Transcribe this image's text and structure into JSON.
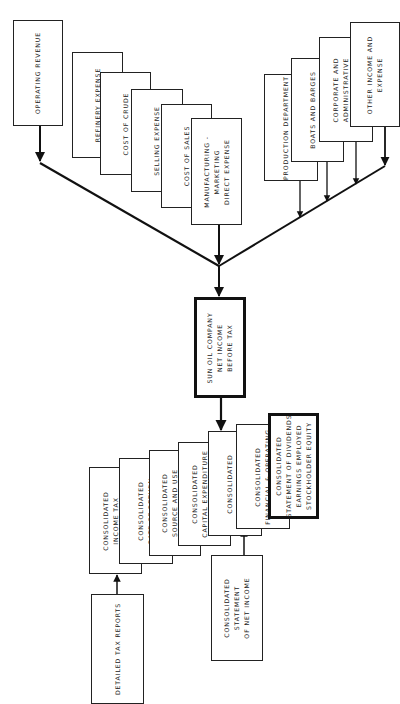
{
  "diagram": {
    "inputs": {
      "revenue": {
        "lines": [
          "OPERATING REVENUE"
        ]
      },
      "expenses_left": [
        {
          "lines": [
            "REFINERY EXPENSE"
          ]
        },
        {
          "lines": [
            "COST OF CRUDE"
          ]
        },
        {
          "lines": [
            "SELLING EXPENSE"
          ]
        },
        {
          "lines": [
            "COST OF SALES"
          ]
        },
        {
          "lines": [
            "MANUFACTURING -",
            "MARKETING",
            "DIRECT EXPENSE"
          ]
        }
      ],
      "expenses_right": [
        {
          "lines": [
            "PRODUCTION DEPARTMENT",
            "EXPENSE"
          ]
        },
        {
          "lines": [
            "BOATS AND BARGES",
            "EXPENSE"
          ]
        },
        {
          "lines": [
            "CORPORATE AND",
            "ADMINISTRATIVE",
            "EXPENSE"
          ]
        },
        {
          "lines": [
            "OTHER INCOME AND",
            "EXPENSE"
          ]
        }
      ]
    },
    "center": {
      "lines": [
        "SUN OIL COMPANY",
        "NET INCOME",
        "BEFORE TAX"
      ]
    },
    "outputs": [
      {
        "lines": [
          "CONSOLIDATED",
          "INCOME TAX",
          "SUMMARY"
        ]
      },
      {
        "lines": [
          "CONSOLIDATED",
          "RATE OF RETURN"
        ]
      },
      {
        "lines": [
          "CONSOLIDATED",
          "SOURCE AND USE",
          "OF FUNDS"
        ]
      },
      {
        "lines": [
          "CONSOLIDATED",
          "CAPITAL EXPENDITURE",
          "SUMMARY"
        ]
      },
      {
        "lines": [
          "CONSOLIDATED",
          "NET INCOME SUMMARY"
        ]
      },
      {
        "lines": [
          "CONSOLIDATED",
          "FINANCIAL & OPERATING"
        ]
      },
      {
        "lines": [
          "CONSOLIDATED",
          "STATEMENT OF DIVIDENDS",
          "EARNINGS EMPLOYED",
          "STOCKHOLDER EQUITY"
        ]
      }
    ],
    "sub_reports": [
      {
        "lines": [
          "DETAILED TAX REPORTS"
        ]
      },
      {
        "lines": [
          "CONSOLIDATED",
          "STATEMENT",
          "OF NET INCOME"
        ]
      }
    ]
  }
}
